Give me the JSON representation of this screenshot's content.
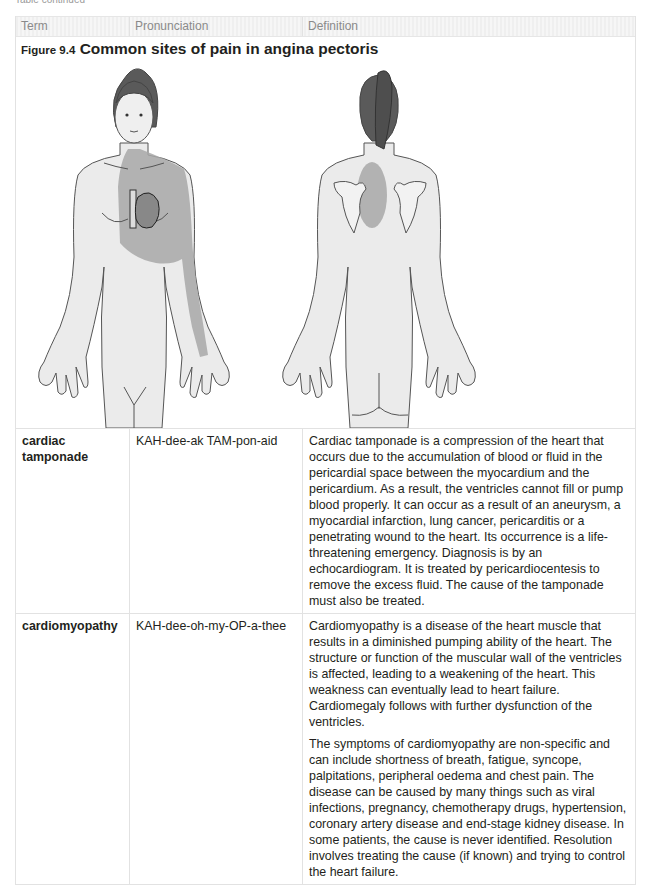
{
  "page": {
    "continued_label": "Table continued"
  },
  "table": {
    "headers": [
      "Term",
      "Pronunciation",
      "Definition"
    ],
    "figure": {
      "number": "Figure 9.4",
      "title": "Common sites of pain in angina pectoris",
      "views": [
        "front view",
        "back view"
      ],
      "pain_shade_color": "#a8a8a8",
      "skin_color": "#ebebeb",
      "hair_color": "#5a5a5a"
    },
    "rows": [
      {
        "term": "cardiac tamponade",
        "pronunciation": "KAH-dee-ak TAM-pon-aid",
        "definition": [
          "Cardiac tamponade is a compression of the heart that occurs due to the accumulation of blood or fluid in the pericardial space between the myocardium and the pericardium. As a result, the ventricles cannot fill or pump blood properly. It can occur as a result of an aneurysm, a myocardial infarction, lung cancer, pericarditis or a penetrating wound to the heart. Its occurrence is a life-threatening emergency. Diagnosis is by an echocardiogram. It is treated by pericardiocentesis to remove the excess fluid. The cause of the tamponade must also be treated."
        ]
      },
      {
        "term": "cardiomyopathy",
        "pronunciation": "KAH-dee-oh-my-OP-a-thee",
        "definition": [
          "Cardiomyopathy is a disease of the heart muscle that results in a diminished pumping ability of the heart. The structure or function of the muscular wall of the ventricles is affected, leading to a weakening of the heart. This weakness can eventually lead to heart failure. Cardiomegaly follows with further dysfunction of the ventricles.",
          "The symptoms of cardiomyopathy are non-specific and can include shortness of breath, fatigue, syncope, palpitations, peripheral oedema and chest pain. The disease can be caused by many things such as viral infections, pregnancy, chemotherapy drugs, hypertension, coronary artery disease and end-stage kidney disease. In some patients, the cause is never identified. Resolution involves treating the cause (if known) and trying to control the heart failure."
        ]
      }
    ]
  }
}
